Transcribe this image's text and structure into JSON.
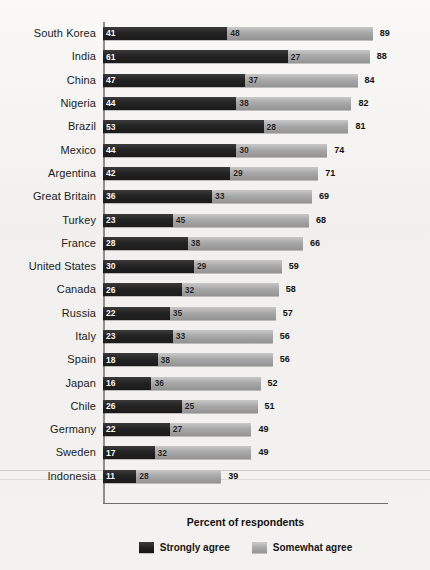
{
  "chart_data": {
    "type": "bar",
    "orientation": "horizontal",
    "stacked": true,
    "title": "",
    "xlabel": "Percent of respondents",
    "ylabel": "",
    "xlim": [
      0,
      100
    ],
    "grid": false,
    "legend_position": "bottom",
    "categories": [
      "South Korea",
      "India",
      "China",
      "Nigeria",
      "Brazil",
      "Mexico",
      "Argentina",
      "Great Britain",
      "Turkey",
      "France",
      "United States",
      "Canada",
      "Russia",
      "Italy",
      "Spain",
      "Japan",
      "Chile",
      "Germany",
      "Sweden",
      "Indonesia"
    ],
    "series": [
      {
        "name": "Strongly agree",
        "color": "#1e1e1e",
        "values": [
          41,
          61,
          47,
          44,
          53,
          44,
          42,
          36,
          23,
          28,
          30,
          26,
          22,
          23,
          18,
          16,
          26,
          22,
          17,
          11
        ]
      },
      {
        "name": "Somewhat agree",
        "color": "#a5a5a5",
        "values": [
          48,
          27,
          37,
          38,
          28,
          30,
          29,
          33,
          45,
          38,
          29,
          32,
          35,
          33,
          38,
          36,
          25,
          27,
          32,
          28
        ]
      }
    ],
    "totals": [
      89,
      88,
      84,
      82,
      81,
      74,
      71,
      69,
      68,
      66,
      59,
      58,
      57,
      56,
      56,
      52,
      51,
      49,
      49,
      39
    ]
  },
  "legend": {
    "items": [
      {
        "label": "Strongly agree",
        "swatch": "strong"
      },
      {
        "label": "Somewhat agree",
        "swatch": "somewhat"
      }
    ]
  }
}
